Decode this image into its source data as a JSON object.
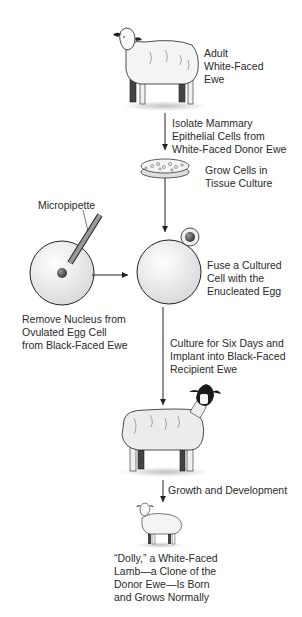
{
  "diagram": {
    "nodes": {
      "adult_ewe": {
        "lines": [
          "Adult",
          "White-Faced",
          "Ewe"
        ]
      },
      "step_isolate": {
        "lines": [
          "Isolate Mammary",
          "Epithelial Cells from",
          "White-Faced Donor Ewe"
        ]
      },
      "culture_dish": {
        "lines": [
          "Grow Cells in",
          "Tissue Culture"
        ]
      },
      "micropipette": {
        "label": "Micropipette"
      },
      "remove_nucleus": {
        "lines": [
          "Remove Nucleus from",
          "Ovulated Egg Cell",
          "from Black-Faced Ewe"
        ]
      },
      "fuse": {
        "lines": [
          "Fuse a Cultured",
          "Cell with the",
          "Enucleated Egg"
        ]
      },
      "implant": {
        "lines": [
          "Culture for Six Days and",
          "Implant into Black-Faced",
          "Recipient Ewe"
        ]
      },
      "growth": {
        "label": "Growth and Development"
      },
      "dolly": {
        "lines": [
          "“Dolly,” a White-Faced",
          "Lamb—a Clone of the",
          "Donor Ewe—Is Born",
          "and Grows Normally"
        ]
      }
    },
    "colors": {
      "line": "#222222",
      "cell_fill": "#eeeeee",
      "nucleus": "#555555",
      "sheep_fill": "#f2f2f2",
      "black_face": "#1a1a1a"
    }
  }
}
